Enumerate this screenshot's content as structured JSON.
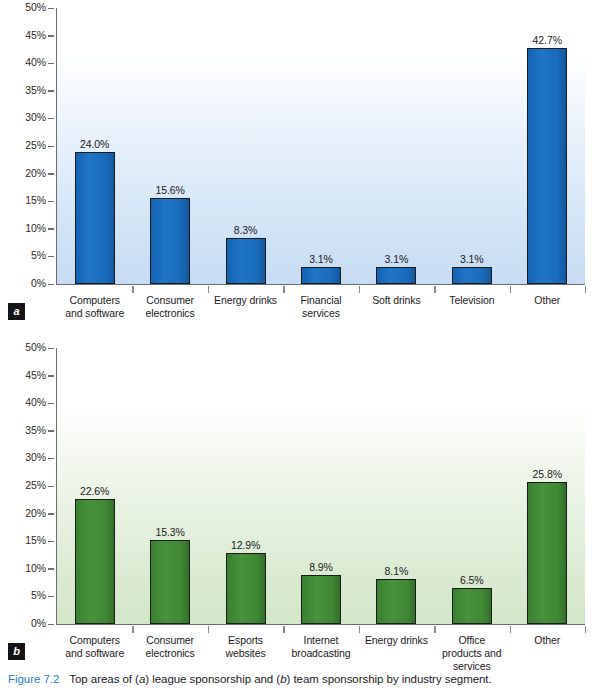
{
  "caption": {
    "figure_number": "Figure 7.2",
    "text_part_1": "Top areas of (",
    "italic_a": "a",
    "text_part_2": ") league sponsorship and (",
    "italic_b": "b",
    "text_part_3": ") team sponsorship by industry segment."
  },
  "colors": {
    "bar_blue": "#1a6fc0",
    "bar_green": "#3f8c35",
    "caption_blue": "#2b7cc4",
    "axis_gray": "#6d6d6d",
    "panel_badge_bg": "#151515"
  },
  "panels": {
    "a": {
      "badge": "a"
    },
    "b": {
      "badge": "b"
    }
  },
  "chart_data": [
    {
      "type": "bar",
      "panel": "a",
      "title": "Top areas of league sponsorship by industry segment",
      "xlabel": "",
      "ylabel": "",
      "ylim": [
        0,
        50
      ],
      "ytick_labels": [
        "0%",
        "5%",
        "10%",
        "15%",
        "20%",
        "25%",
        "30%",
        "35%",
        "40%",
        "45%",
        "50%"
      ],
      "ytick_values": [
        0,
        5,
        10,
        15,
        20,
        25,
        30,
        35,
        40,
        45,
        50
      ],
      "grid": false,
      "legend": "none",
      "bar_color": "#1a6fc0",
      "categories": [
        "Computers and software",
        "Consumer electronics",
        "Energy drinks",
        "Financial services",
        "Soft drinks",
        "Television",
        "Other"
      ],
      "category_lines": [
        [
          "Computers",
          "and software"
        ],
        [
          "Consumer",
          "electronics"
        ],
        [
          "Energy drinks"
        ],
        [
          "Financial",
          "services"
        ],
        [
          "Soft drinks"
        ],
        [
          "Television"
        ],
        [
          "Other"
        ]
      ],
      "values": [
        24.0,
        15.6,
        8.3,
        3.1,
        3.1,
        3.1,
        42.7
      ],
      "data_labels": [
        "24.0%",
        "15.6%",
        "8.3%",
        "3.1%",
        "3.1%",
        "3.1%",
        "42.7%"
      ]
    },
    {
      "type": "bar",
      "panel": "b",
      "title": "Top areas of team sponsorship by industry segment",
      "xlabel": "",
      "ylabel": "",
      "ylim": [
        0,
        50
      ],
      "ytick_labels": [
        "0%",
        "5%",
        "10%",
        "15%",
        "20%",
        "25%",
        "30%",
        "35%",
        "40%",
        "45%",
        "50%"
      ],
      "ytick_values": [
        0,
        5,
        10,
        15,
        20,
        25,
        30,
        35,
        40,
        45,
        50
      ],
      "grid": false,
      "legend": "none",
      "bar_color": "#3f8c35",
      "categories": [
        "Computers and software",
        "Consumer electronics",
        "Esports websites",
        "Internet broadcasting",
        "Energy drinks",
        "Office products and services",
        "Other"
      ],
      "category_lines": [
        [
          "Computers",
          "and software"
        ],
        [
          "Consumer",
          "electronics"
        ],
        [
          "Esports",
          "websites"
        ],
        [
          "Internet",
          "broadcasting"
        ],
        [
          "Energy drinks"
        ],
        [
          "Office",
          "products and",
          "services"
        ],
        [
          "Other"
        ]
      ],
      "values": [
        22.6,
        15.3,
        12.9,
        8.9,
        8.1,
        6.5,
        25.8
      ],
      "data_labels": [
        "22.6%",
        "15.3%",
        "12.9%",
        "8.9%",
        "8.1%",
        "6.5%",
        "25.8%"
      ]
    }
  ]
}
